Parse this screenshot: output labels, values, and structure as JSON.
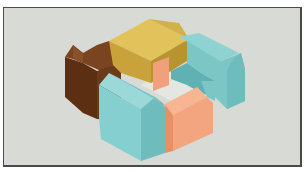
{
  "figure": {
    "background_color": "#d8dad6",
    "frame_color": "#4a4a4a",
    "blocks": [
      {
        "name": "brown-block",
        "color": "#6b3a1a",
        "position": "left"
      },
      {
        "name": "yellow-block",
        "color": "#d9b64a",
        "position": "top"
      },
      {
        "name": "teal-block-right",
        "color": "#7ec8c8",
        "position": "right"
      },
      {
        "name": "teal-block-front",
        "color": "#7ec8c8",
        "position": "front-left"
      },
      {
        "name": "salmon-block-front",
        "color": "#f2a57e",
        "position": "front-center"
      },
      {
        "name": "salmon-block-inner",
        "color": "#f2a57e",
        "position": "courtyard-back"
      }
    ],
    "courtyard_color": "#e4e6e2"
  }
}
